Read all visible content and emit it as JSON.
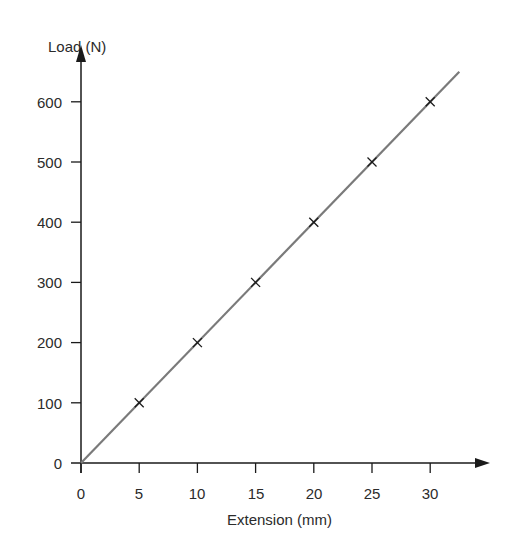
{
  "chart_data": {
    "type": "line",
    "title": "",
    "xlabel": "Extension (mm)",
    "ylabel": "Load (N)",
    "xlim": [
      0,
      32.5
    ],
    "ylim": [
      0,
      650
    ],
    "grid": false,
    "legend": null,
    "x_ticks": [
      "0",
      "5",
      "10",
      "15",
      "20",
      "25",
      "30"
    ],
    "y_ticks": [
      "0",
      "100",
      "200",
      "300",
      "400",
      "500",
      "600"
    ],
    "series": [
      {
        "name": "Load vs Extension",
        "marker": "x",
        "x": [
          5,
          10,
          15,
          20,
          25,
          30
        ],
        "y": [
          100,
          200,
          300,
          400,
          500,
          600
        ]
      }
    ],
    "fit_line": {
      "from": [
        0,
        0
      ],
      "to": [
        32.5,
        650
      ],
      "slope_N_per_mm": 20
    },
    "colors": {
      "axis": "#1a1a1a",
      "line": "#7a7a7a",
      "marker": "#1a1a1a",
      "text": "#2b2b2b"
    }
  }
}
